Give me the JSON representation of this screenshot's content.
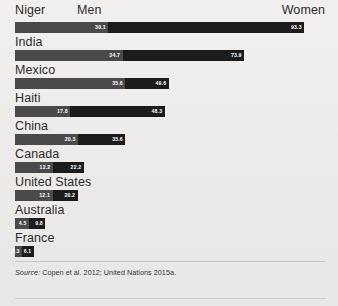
{
  "header": {
    "country_label": "Niger",
    "men_label": "Men",
    "women_label": "Women"
  },
  "source": {
    "lead": "Source:",
    "text": " Copen et al. 2012; United Nations 2015a."
  },
  "colors": {
    "men": "#4a4a4a",
    "women": "#1c1c1c",
    "background": "#efeeec",
    "text": "#2b2b2b"
  },
  "chart_data": {
    "type": "bar",
    "orientation": "horizontal",
    "title": "",
    "xlabel": "",
    "ylabel": "",
    "xlim": [
      0,
      100
    ],
    "grid": false,
    "legend_position": "top",
    "categories": [
      "Niger",
      "India",
      "Mexico",
      "Haiti",
      "China",
      "Canada",
      "United States",
      "Australia",
      "France"
    ],
    "series": [
      {
        "name": "Men",
        "values": [
          30.1,
          34.7,
          35.6,
          17.8,
          20.3,
          12.2,
          12.1,
          4.5,
          2.3
        ]
      },
      {
        "name": "Women",
        "values": [
          93.3,
          73.9,
          49.6,
          48.3,
          35.6,
          22.2,
          20.2,
          9.8,
          6.1
        ]
      }
    ],
    "rows": [
      {
        "label": "Niger",
        "men": 30.1,
        "women": 93.3,
        "men_text": "30.1",
        "women_text": "93.3"
      },
      {
        "label": "India",
        "men": 34.7,
        "women": 73.9,
        "men_text": "34.7",
        "women_text": "73.9"
      },
      {
        "label": "Mexico",
        "men": 35.6,
        "women": 49.6,
        "men_text": "35.6",
        "women_text": "49.6"
      },
      {
        "label": "Haiti",
        "men": 17.8,
        "women": 48.3,
        "men_text": "17.8",
        "women_text": "48.3"
      },
      {
        "label": "China",
        "men": 20.3,
        "women": 35.6,
        "men_text": "20.3",
        "women_text": "35.6"
      },
      {
        "label": "Canada",
        "men": 12.2,
        "women": 22.2,
        "men_text": "12.2",
        "women_text": "22.2"
      },
      {
        "label": "United States",
        "men": 12.1,
        "women": 20.2,
        "men_text": "12.1",
        "women_text": "20.2"
      },
      {
        "label": "Australia",
        "men": 4.5,
        "women": 9.8,
        "men_text": "4.5",
        "women_text": "9.8"
      },
      {
        "label": "France",
        "men": 2.3,
        "women": 6.1,
        "men_text": "2.3",
        "women_text": "6.1"
      }
    ]
  }
}
